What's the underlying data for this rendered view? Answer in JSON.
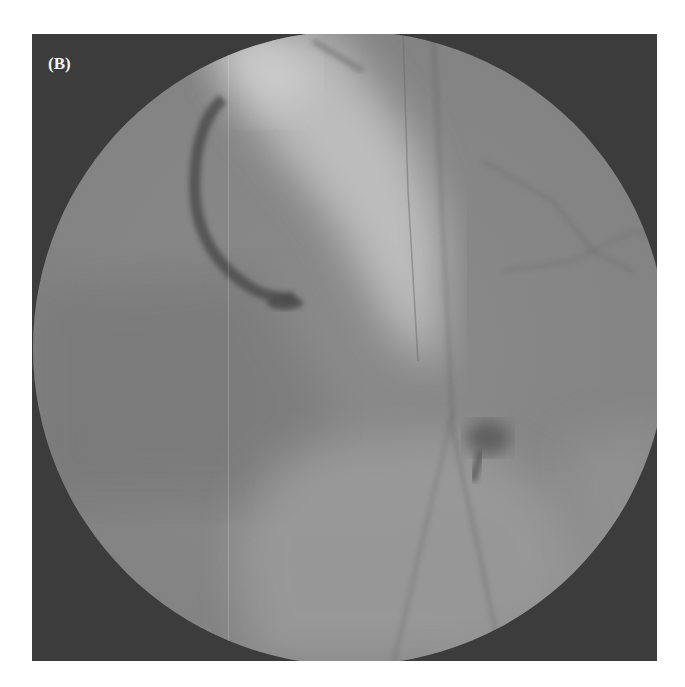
{
  "figure": {
    "panel_label": "(B)",
    "image_type": "fluoroscopic angiography",
    "colors": {
      "background": "#ffffff",
      "frame": "#3c3c3c",
      "field": "#858585",
      "bright_region": "#c8c8c8",
      "vessel": "#4a4a4a"
    }
  }
}
